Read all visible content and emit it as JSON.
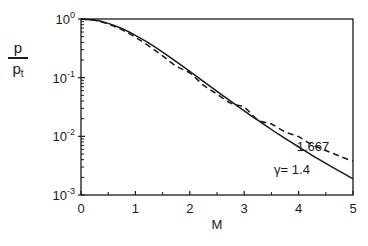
{
  "chart_data": {
    "type": "line",
    "title": "",
    "xlabel": "M",
    "ylabel": "p / p_t",
    "ylabel_parts": {
      "numerator": "p",
      "denominator": "p",
      "denominator_sub": "t"
    },
    "xscale": "linear",
    "yscale": "log",
    "xlim": [
      0,
      5
    ],
    "ylim": [
      0.001,
      1
    ],
    "x_ticks": [
      0,
      1,
      2,
      3,
      4,
      5
    ],
    "x_minor_ticks": [
      0.5,
      1.5,
      2.5,
      3.5,
      4.5
    ],
    "y_ticks": [
      {
        "value": 1,
        "base": "10",
        "exp": "0"
      },
      {
        "value": 0.1,
        "base": "10",
        "exp": "-1"
      },
      {
        "value": 0.01,
        "base": "10",
        "exp": "-2"
      },
      {
        "value": 0.001,
        "base": "10",
        "exp": "-3"
      }
    ],
    "grid": false,
    "legend": "none (inline curve labels)",
    "series": [
      {
        "name": "γ = 1.4",
        "label": "γ = 1.4",
        "style": "solid",
        "x": [
          0,
          0.25,
          0.5,
          0.75,
          1.0,
          1.25,
          1.5,
          1.75,
          2.0,
          2.25,
          2.5,
          2.75,
          3.0,
          3.25,
          3.5,
          3.75,
          4.0,
          4.25,
          4.5,
          4.75,
          5.0
        ],
        "values": [
          1.0,
          0.9575,
          0.843,
          0.6886,
          0.5283,
          0.3861,
          0.2724,
          0.1878,
          0.1278,
          0.0865,
          0.0585,
          0.0398,
          0.0272,
          0.0188,
          0.0131,
          0.00926,
          0.00659,
          0.00474,
          0.00346,
          0.00254,
          0.00189
        ]
      },
      {
        "name": "γ = 1.667",
        "label": "1.667",
        "style": "dashed",
        "x": [
          0,
          0.25,
          0.5,
          0.75,
          1.0,
          1.25,
          1.5,
          1.75,
          2.0,
          2.25,
          2.5,
          2.75,
          3.0,
          3.25,
          3.5,
          3.75,
          4.0,
          4.25,
          4.5,
          4.75,
          5.0
        ],
        "values": [
          1.0,
          0.9511,
          0.8218,
          0.6562,
          0.4871,
          0.345,
          0.235,
          0.1566,
          0.12,
          0.0745,
          0.0524,
          0.0367,
          0.0312,
          0.019,
          0.0162,
          0.0119,
          0.00987,
          0.00716,
          0.00574,
          0.00461,
          0.00375
        ]
      }
    ],
    "annotations": [
      {
        "text": "1.667",
        "x": 4.25,
        "y": 0.0085,
        "series": "γ = 1.667"
      },
      {
        "text": "γ = 1.4",
        "x": 3.3,
        "y": 0.0029,
        "series": "γ = 1.4"
      }
    ]
  },
  "labels": {
    "xlabel": "M",
    "ylabel_num": "p",
    "ylabel_den": "p",
    "ylabel_den_sub": "t",
    "anno_dashed": "1.667",
    "anno_solid": "γ= 1.4"
  }
}
